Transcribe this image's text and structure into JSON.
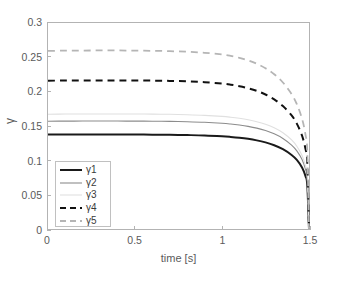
{
  "chart_data": {
    "type": "line",
    "title": "",
    "xlabel": "time [s]",
    "ylabel": "γ",
    "xlim": [
      0,
      1.5
    ],
    "ylim": [
      0,
      0.3
    ],
    "xticks": [
      "0",
      "0.5",
      "1",
      "1.5"
    ],
    "xtick_values": [
      0,
      0.5,
      1,
      1.5
    ],
    "yticks": [
      "0",
      "0.05",
      "0.1",
      "0.15",
      "0.2",
      "0.25",
      "0.3"
    ],
    "ytick_values": [
      0,
      0.05,
      0.1,
      0.15,
      0.2,
      0.25,
      0.3
    ],
    "grid": false,
    "legend_position": "lower left",
    "x": [
      0,
      0.1,
      0.2,
      0.3,
      0.4,
      0.5,
      0.6,
      0.7,
      0.8,
      0.9,
      1.0,
      1.05,
      1.1,
      1.15,
      1.2,
      1.25,
      1.3,
      1.35,
      1.4,
      1.43,
      1.46,
      1.48,
      1.49,
      1.5
    ],
    "series": [
      {
        "name": "γ1",
        "color": "#1a1a1a",
        "width": 2.0,
        "dash": "none",
        "values": [
          0.1375,
          0.1376,
          0.1376,
          0.1376,
          0.1376,
          0.1375,
          0.1374,
          0.1372,
          0.1368,
          0.1362,
          0.135,
          0.1341,
          0.1329,
          0.1313,
          0.1291,
          0.1261,
          0.122,
          0.1162,
          0.1078,
          0.1006,
          0.0896,
          0.077,
          0.064,
          0.0
        ]
      },
      {
        "name": "γ2",
        "color": "#8c8c8c",
        "width": 1.1,
        "dash": "none",
        "values": [
          0.157,
          0.1571,
          0.1572,
          0.1572,
          0.1572,
          0.1571,
          0.157,
          0.1567,
          0.1562,
          0.1554,
          0.154,
          0.1529,
          0.1514,
          0.1495,
          0.1469,
          0.1434,
          0.1386,
          0.1319,
          0.1222,
          0.1138,
          0.1012,
          0.0868,
          0.072,
          0.0
        ]
      },
      {
        "name": "γ3",
        "color": "#e0e0e0",
        "width": 1.1,
        "dash": "none",
        "values": [
          0.1672,
          0.1674,
          0.1675,
          0.1675,
          0.1675,
          0.1674,
          0.1673,
          0.167,
          0.1664,
          0.1655,
          0.164,
          0.1628,
          0.1612,
          0.1591,
          0.1563,
          0.1525,
          0.1473,
          0.1401,
          0.1297,
          0.1206,
          0.1071,
          0.0918,
          0.076,
          0.0
        ]
      },
      {
        "name": "γ4",
        "color": "#111111",
        "width": 2.0,
        "dash": "dashed",
        "values": [
          0.216,
          0.2162,
          0.2163,
          0.2164,
          0.2164,
          0.2163,
          0.2161,
          0.2157,
          0.215,
          0.2138,
          0.2118,
          0.2102,
          0.208,
          0.205,
          0.2011,
          0.1959,
          0.1888,
          0.1791,
          0.1654,
          0.1535,
          0.136,
          0.1164,
          0.0962,
          0.0
        ]
      },
      {
        "name": "γ5",
        "color": "#b5b5b5",
        "width": 1.8,
        "dash": "dashed",
        "values": [
          0.2594,
          0.2597,
          0.2599,
          0.26,
          0.26,
          0.2598,
          0.2595,
          0.259,
          0.2581,
          0.2566,
          0.2541,
          0.2521,
          0.2493,
          0.2456,
          0.2407,
          0.2341,
          0.2253,
          0.2133,
          0.1964,
          0.1818,
          0.1606,
          0.137,
          0.113,
          0.0
        ]
      }
    ]
  },
  "axes": {
    "x_title": "time [s]",
    "y_title": "γ"
  },
  "legend": {
    "entries": [
      {
        "label": "γ1"
      },
      {
        "label": "γ2"
      },
      {
        "label": "γ3"
      },
      {
        "label": "γ4"
      },
      {
        "label": "γ5"
      }
    ]
  },
  "colors": {
    "frame": "#b3b3b3",
    "text": "#5a5a5a",
    "background": "#ffffff"
  }
}
